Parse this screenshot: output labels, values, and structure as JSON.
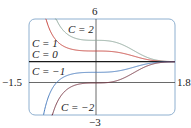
{
  "chart_data": {
    "type": "line",
    "title": "",
    "xlabel": "",
    "ylabel": "",
    "xlim": [
      -1.5,
      1.8
    ],
    "ylim": [
      -3,
      6
    ],
    "grid": false,
    "legend": "inline labels",
    "function": "y = 2 + C*exp(-x^3)",
    "tick_labels": {
      "x_min": "−1.5",
      "x_max": "1.8",
      "y_max": "6",
      "y_min": "−3"
    },
    "series": [
      {
        "name": "C = 2",
        "C": 2,
        "color": "#8fa89c",
        "label": "C = 2"
      },
      {
        "name": "C = 1",
        "C": 1,
        "color": "#c8463f",
        "label": "C = 1"
      },
      {
        "name": "C = 0",
        "C": 0,
        "color": "#1a1a1a",
        "label": "C = 0"
      },
      {
        "name": "C = −1",
        "C": -1,
        "color": "#4a7dbf",
        "label": "C = −1"
      },
      {
        "name": "C = −2",
        "C": -2,
        "color": "#7a3a48",
        "label": "C = −2"
      }
    ],
    "sample_values_at_x0": {
      "C = 2": 4,
      "C = 1": 3,
      "C = 0": 2,
      "C = −1": 1,
      "C = −2": 0
    },
    "asymptote_right": 2
  },
  "frame": {
    "border_color": "#8fb0d0",
    "axis_color": "#444444"
  }
}
